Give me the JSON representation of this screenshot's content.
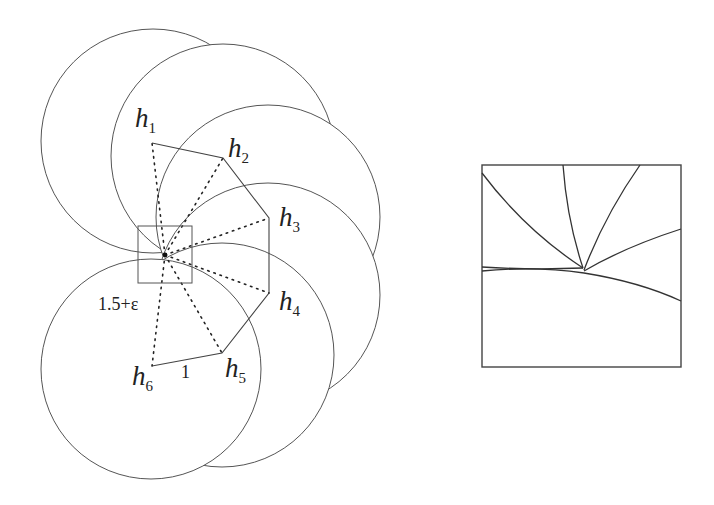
{
  "figure": {
    "left_panel": {
      "center_point": {
        "x": 165,
        "y": 255
      },
      "nodes": [
        {
          "id": "h1",
          "base": "h",
          "sub": "1",
          "x": 152,
          "y": 143,
          "label_x": 135,
          "label_y": 127
        },
        {
          "id": "h2",
          "base": "h",
          "sub": "2",
          "x": 223,
          "y": 158,
          "label_x": 228,
          "label_y": 157
        },
        {
          "id": "h3",
          "base": "h",
          "sub": "3",
          "x": 269,
          "y": 218,
          "label_x": 279,
          "label_y": 226
        },
        {
          "id": "h4",
          "base": "h",
          "sub": "4",
          "x": 269,
          "y": 293,
          "label_x": 279,
          "label_y": 310
        },
        {
          "id": "h5",
          "base": "h",
          "sub": "5",
          "x": 222,
          "y": 353,
          "label_x": 225,
          "label_y": 377
        },
        {
          "id": "h6",
          "base": "h",
          "sub": "6",
          "x": 152,
          "y": 366,
          "label_x": 132,
          "label_y": 385
        }
      ],
      "labels": {
        "radius_label": "1.5+ε",
        "edge_label": "1"
      },
      "zoom_box": {
        "x": 138,
        "y": 226,
        "width": 54,
        "height": 57
      }
    },
    "right_panel": {
      "title": "",
      "box": {
        "x": 482,
        "y": 165,
        "width": 199,
        "height": 202
      }
    }
  }
}
